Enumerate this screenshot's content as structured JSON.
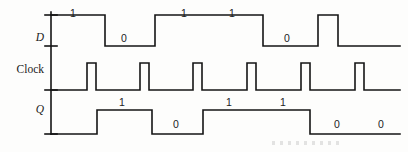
{
  "figure": {
    "width": 408,
    "height": 152,
    "background": "#fdfdfc",
    "stroke_color": "#141414",
    "stroke_width": 1.6,
    "axis_x": 51,
    "axis_top": 12,
    "axis_bottom": 134
  },
  "rows": [
    {
      "name": "D",
      "label": "D",
      "italic": true,
      "label_x": 30,
      "label_y": 31,
      "baseline_y": 46,
      "high_y": 15
    },
    {
      "name": "Clock",
      "label": "Clock",
      "italic": false,
      "label_x": 8,
      "label_y": 63,
      "baseline_y": 90,
      "high_y": 63
    },
    {
      "name": "Q",
      "label": "Q",
      "italic": true,
      "label_x": 30,
      "label_y": 103,
      "baseline_y": 134,
      "high_y": 110
    }
  ],
  "chart_data": {
    "type": "line",
    "xlabel": "",
    "ylabel": "",
    "x_range": [
      51,
      400
    ],
    "signals": [
      {
        "name": "D",
        "label": "D",
        "baseline_y": 46,
        "high_y": 15,
        "segments": [
          {
            "x_start": 51,
            "x_end": 105,
            "level": 1
          },
          {
            "x_start": 105,
            "x_end": 155,
            "level": 0
          },
          {
            "x_start": 155,
            "x_end": 263,
            "level": 1
          },
          {
            "x_start": 263,
            "x_end": 318,
            "level": 0
          },
          {
            "x_start": 318,
            "x_end": 338,
            "level": 1
          },
          {
            "x_start": 338,
            "x_end": 400,
            "level": 0
          }
        ],
        "bit_labels": [
          {
            "text": "1",
            "x": 73,
            "y": 7
          },
          {
            "text": "0",
            "x": 124,
            "y": 32
          },
          {
            "text": "1",
            "x": 184,
            "y": 7
          },
          {
            "text": "1",
            "x": 232,
            "y": 7
          },
          {
            "text": "0",
            "x": 287,
            "y": 32
          }
        ]
      },
      {
        "name": "Clock",
        "label": "Clock",
        "baseline_y": 90,
        "high_y": 63,
        "pulses": [
          {
            "x_start": 87,
            "x_end": 96
          },
          {
            "x_start": 140,
            "x_end": 149
          },
          {
            "x_start": 193,
            "x_end": 202
          },
          {
            "x_start": 247,
            "x_end": 256
          },
          {
            "x_start": 301,
            "x_end": 310
          },
          {
            "x_start": 355,
            "x_end": 364
          }
        ],
        "bit_labels": []
      },
      {
        "name": "Q",
        "label": "Q",
        "baseline_y": 134,
        "high_y": 110,
        "segments": [
          {
            "x_start": 51,
            "x_end": 97,
            "level": 0
          },
          {
            "x_start": 97,
            "x_end": 152,
            "level": 1
          },
          {
            "x_start": 152,
            "x_end": 203,
            "level": 0
          },
          {
            "x_start": 203,
            "x_end": 310,
            "level": 1
          },
          {
            "x_start": 310,
            "x_end": 400,
            "level": 0
          }
        ],
        "bit_labels": [
          {
            "text": "1",
            "x": 122,
            "y": 96
          },
          {
            "text": "0",
            "x": 176,
            "y": 118
          },
          {
            "text": "1",
            "x": 229,
            "y": 96
          },
          {
            "text": "1",
            "x": 283,
            "y": 96
          },
          {
            "text": "0",
            "x": 337,
            "y": 118
          },
          {
            "text": "0",
            "x": 381,
            "y": 118
          }
        ]
      }
    ],
    "axis_ticks": [
      {
        "y": 15,
        "x_start": 45,
        "x_end": 57
      },
      {
        "y": 46,
        "x_start": 45,
        "x_end": 57
      },
      {
        "y": 90,
        "x_start": 45,
        "x_end": 57
      },
      {
        "y": 134,
        "x_start": 45,
        "x_end": 57
      }
    ],
    "grid": false,
    "legend": "none"
  }
}
